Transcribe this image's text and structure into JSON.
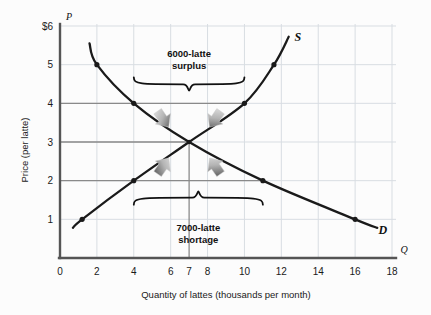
{
  "chart_data": {
    "type": "line",
    "title": "",
    "xlabel": "Quantity of lattes (thousands per month)",
    "ylabel": "Price (per latte)",
    "x_axis_symbol": "Q",
    "y_axis_symbol": "P",
    "xlim": [
      0,
      18
    ],
    "ylim": [
      0,
      6
    ],
    "grid": true,
    "legend_position": "inline-curve-end",
    "x_ticks": [
      "0",
      "2",
      "4",
      "6",
      "7",
      "8",
      "10",
      "12",
      "14",
      "16",
      "18"
    ],
    "x_tick_values": [
      0,
      2,
      4,
      6,
      7,
      8,
      10,
      12,
      14,
      16,
      18
    ],
    "y_ticks": [
      "1",
      "2",
      "3",
      "4",
      "5",
      "$6"
    ],
    "y_tick_values": [
      1,
      2,
      3,
      4,
      5,
      6
    ],
    "series": [
      {
        "name": "D",
        "label": "D",
        "description": "Demand curve",
        "color": "#1a1a1a",
        "points": [
          {
            "x": 1.6,
            "y": 5.55
          },
          {
            "x": 2.0,
            "y": 5.0
          },
          {
            "x": 4.0,
            "y": 4.0
          },
          {
            "x": 7.0,
            "y": 3.0
          },
          {
            "x": 11.0,
            "y": 2.0
          },
          {
            "x": 16.0,
            "y": 1.0
          },
          {
            "x": 17.2,
            "y": 0.78
          }
        ],
        "markers": [
          {
            "x": 2.0,
            "y": 5.0
          },
          {
            "x": 4.0,
            "y": 4.0
          },
          {
            "x": 11.0,
            "y": 2.0
          },
          {
            "x": 16.0,
            "y": 1.0
          }
        ]
      },
      {
        "name": "S",
        "label": "S",
        "description": "Supply curve",
        "color": "#1a1a1a",
        "points": [
          {
            "x": 0.7,
            "y": 0.78
          },
          {
            "x": 1.2,
            "y": 1.0
          },
          {
            "x": 4.0,
            "y": 2.0
          },
          {
            "x": 7.0,
            "y": 3.0
          },
          {
            "x": 10.0,
            "y": 4.0
          },
          {
            "x": 11.6,
            "y": 5.0
          },
          {
            "x": 12.4,
            "y": 5.72
          }
        ],
        "markers": [
          {
            "x": 1.2,
            "y": 1.0
          },
          {
            "x": 4.0,
            "y": 2.0
          },
          {
            "x": 10.0,
            "y": 4.0
          },
          {
            "x": 11.6,
            "y": 5.0
          }
        ]
      }
    ],
    "equilibrium": {
      "x": 7,
      "y": 3
    },
    "reference_lines": [
      {
        "price": 4,
        "from_x": 0,
        "to_x": 10,
        "orientation": "horizontal"
      },
      {
        "price": 3,
        "from_x": 0,
        "to_x": 7,
        "orientation": "horizontal"
      },
      {
        "price": 2,
        "from_x": 0,
        "to_x": 11,
        "orientation": "horizontal"
      },
      {
        "quantity": 7,
        "from_y": 0,
        "to_y": 3,
        "orientation": "vertical"
      }
    ],
    "annotations": [
      {
        "id": "surplus",
        "line1": "6000-latte",
        "line2": "surplus",
        "at_price": 4,
        "span_x": [
          4,
          10
        ],
        "brace": "below",
        "arrows": "inward-down"
      },
      {
        "id": "shortage",
        "line1": "7000-latte",
        "line2": "shortage",
        "at_price": 2,
        "span_x": [
          4,
          11
        ],
        "brace": "above",
        "arrows": "inward-up"
      }
    ]
  },
  "colors": {
    "background": "#fcfcfc",
    "curve": "#1a1a1a",
    "axis": "#555555",
    "grid": "#d8dde2",
    "reference_line": "#8a8a8a",
    "arrow": "#9a9a9a",
    "text": "#1a1a1a"
  }
}
